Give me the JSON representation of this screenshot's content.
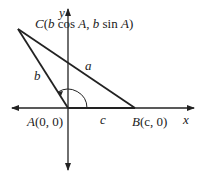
{
  "diagram": {
    "axes": {
      "x_label": "x",
      "y_label": "y"
    },
    "points": {
      "A": {
        "label_name": "A",
        "label_coords": "(0, 0)"
      },
      "B": {
        "label_name": "B",
        "label_coords": "(c, 0)"
      },
      "C": {
        "label_name": "C",
        "label_coords_open": "(",
        "label_b1": "b",
        "label_cos": " cos ",
        "label_A1": "A",
        "label_comma": ", ",
        "label_b2": "b",
        "label_sin": " sin ",
        "label_A2": "A",
        "label_close": ")"
      }
    },
    "sides": {
      "a": "a",
      "b": "b",
      "c": "c"
    },
    "colors": {
      "line": "#222222",
      "background": "#ffffff"
    }
  }
}
